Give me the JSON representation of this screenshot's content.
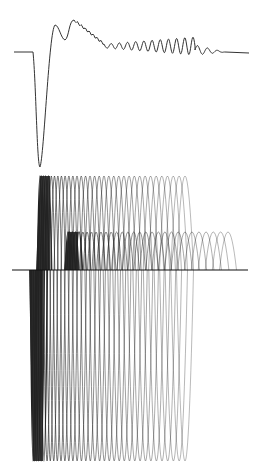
{
  "figure": {
    "background": "#ffffff",
    "ink": "#1a1a1a",
    "top_panel": {
      "description": "damped oscillatory response waveform",
      "baseline_y": 52,
      "x_start": 14,
      "x_end": 249,
      "step_x": 33,
      "trough": {
        "x": 40,
        "y": 167
      },
      "peaks": [
        {
          "x": 55,
          "y": 25
        },
        {
          "x": 74,
          "y": 20
        }
      ],
      "ripple_start_x": 84,
      "ripple_end_x": 195,
      "ripple_count": 11,
      "tail_end_x": 225,
      "stroke_color": "#333333"
    },
    "bottom_panel": {
      "description": "superimposed sinusoidal traces (sweep family)",
      "baseline": {
        "y": 270,
        "x1": 12,
        "x2": 248
      },
      "upper_set_a": {
        "top_y": 176,
        "x_start": 40,
        "x_end": 185,
        "count": 34
      },
      "upper_set_b": {
        "top_y": 232,
        "x_start": 68,
        "x_end": 228,
        "count": 30
      },
      "lower_set": {
        "bottom_y": 461,
        "x_start": 33,
        "x_end": 185,
        "count": 36
      },
      "stroke_color": "#222222"
    }
  }
}
